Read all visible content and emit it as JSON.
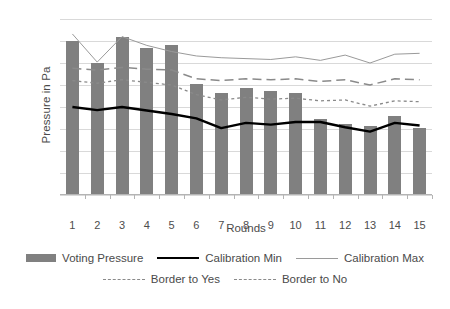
{
  "chart_data": {
    "type": "bar",
    "title": "",
    "xlabel": "Rounds",
    "ylabel": "Pressure in Pa",
    "categories": [
      "1",
      "2",
      "3",
      "4",
      "5",
      "6",
      "7",
      "8",
      "9",
      "10",
      "11",
      "12",
      "13",
      "14",
      "15"
    ],
    "ylim": [
      94810,
      94850
    ],
    "ytick_step": 5,
    "ytick_labels": [
      "94850",
      "94845",
      "94840",
      "94835",
      "94830",
      "94825",
      "94820",
      "94815",
      "94810"
    ],
    "grid": true,
    "legend_position": "bottom",
    "series": [
      {
        "name": "Voting Pressure",
        "type": "bar",
        "color": "#808080",
        "values": [
          94845,
          94840,
          94846,
          94843.5,
          94844,
          94835.2,
          94833.2,
          94834.3,
          94833.6,
          94833.2,
          94827.2,
          94826.2,
          94825.6,
          94828,
          94825.2
        ]
      },
      {
        "name": "Calibration Min",
        "type": "line",
        "color": "#000000",
        "style": "solid",
        "values": [
          94830,
          94829.3,
          94830,
          94829.2,
          94828.4,
          94827.4,
          94825.2,
          94826.4,
          94826,
          94826.6,
          94826.6,
          94825.4,
          94824.4,
          94826.4,
          94825.8
        ]
      },
      {
        "name": "Calibration Max",
        "type": "line",
        "color": "#9a9a9a",
        "style": "solid-thin",
        "values": [
          94846.6,
          94840.2,
          94846,
          94844,
          94842.6,
          94841.6,
          94841.2,
          94841,
          94840.8,
          94841.4,
          94840.6,
          94841.8,
          94840,
          94842,
          94842.2
        ]
      },
      {
        "name": "Border to Yes",
        "type": "line",
        "color": "#8a8a8a",
        "style": "dashed",
        "values": [
          94838.8,
          94838.4,
          94839,
          94838.6,
          94838.4,
          94836.4,
          94836,
          94836.4,
          94836.2,
          94836.4,
          94835.8,
          94836.2,
          94835,
          94836.4,
          94836.2
        ]
      },
      {
        "name": "Border to No",
        "type": "line",
        "color": "#8a8a8a",
        "style": "dotted",
        "values": [
          94836,
          94835.4,
          94836.2,
          94835.6,
          94835,
          94832.8,
          94831.6,
          94832.2,
          94831.8,
          94832,
          94831.4,
          94831.6,
          94830.2,
          94831.4,
          94831.2
        ]
      }
    ]
  },
  "legend": {
    "rows": [
      [
        {
          "label": "Voting Pressure",
          "marker": "bar-swatch"
        },
        {
          "label": "Calibration Min",
          "marker": "solid-line"
        },
        {
          "label": "Calibration Max",
          "marker": "thin-line"
        }
      ],
      [
        {
          "label": "Border to Yes",
          "marker": "dashed-line"
        },
        {
          "label": "Border to No",
          "marker": "dotted-line"
        }
      ]
    ]
  }
}
